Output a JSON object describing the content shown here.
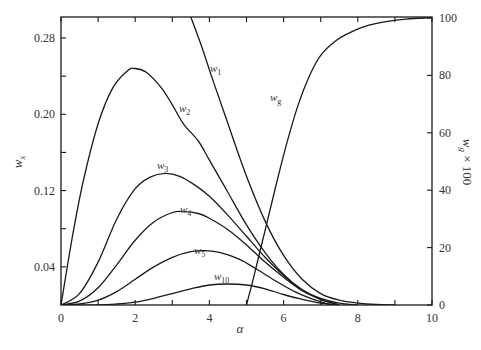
{
  "chart_data": {
    "type": "line",
    "title": "",
    "xlabel": "α",
    "ylabel_left": "w_x",
    "ylabel_right": "w_g × 100",
    "xlim": [
      0,
      10
    ],
    "ylim_left": [
      0,
      0.302
    ],
    "ylim_right": [
      0,
      100
    ],
    "x_ticks": [
      0,
      2,
      4,
      6,
      8,
      10
    ],
    "x_minor_ticks": [
      1,
      3,
      5,
      7,
      9
    ],
    "y_left_ticks": [
      "0.04",
      "0.12",
      "0.20",
      "0.28"
    ],
    "y_left_tick_values": [
      0.04,
      0.12,
      0.2,
      0.28
    ],
    "y_left_minor_ticks": [
      0.08,
      0.16,
      0.24
    ],
    "y_right_ticks": [
      0,
      20,
      40,
      60,
      80,
      100
    ],
    "grid": false,
    "legend": "inline labels",
    "series": [
      {
        "name": "w1",
        "label": "w",
        "sub": "1",
        "axis": "left",
        "x": [
          3.5,
          3.8,
          4.1,
          4.5,
          5.0,
          5.5,
          6.0,
          6.5,
          7.0,
          7.5,
          8.0,
          8.5,
          9.0
        ],
        "y": [
          0.302,
          0.27,
          0.235,
          0.19,
          0.135,
          0.088,
          0.052,
          0.027,
          0.012,
          0.005,
          0.002,
          0.0005,
          0.0
        ]
      },
      {
        "name": "w2",
        "label": "w",
        "sub": "2",
        "axis": "left",
        "x": [
          0,
          0.3,
          0.6,
          1.0,
          1.4,
          1.8,
          2.0,
          2.3,
          2.7,
          3.0,
          3.3,
          3.7,
          4.0,
          4.5,
          5.0,
          5.5,
          6.0,
          6.5,
          7.0,
          7.5,
          8.0
        ],
        "y": [
          0.0,
          0.07,
          0.13,
          0.19,
          0.228,
          0.246,
          0.248,
          0.244,
          0.228,
          0.21,
          0.19,
          0.172,
          0.152,
          0.118,
          0.084,
          0.055,
          0.032,
          0.016,
          0.007,
          0.002,
          0.0
        ]
      },
      {
        "name": "w3",
        "label": "w",
        "sub": "3",
        "axis": "left",
        "x": [
          0,
          0.5,
          1.0,
          1.5,
          2.0,
          2.4,
          2.8,
          3.2,
          3.6,
          4.0,
          4.5,
          5.0,
          5.5,
          6.0,
          6.5,
          7.0,
          7.5
        ],
        "y": [
          0.0,
          0.012,
          0.045,
          0.09,
          0.122,
          0.134,
          0.138,
          0.135,
          0.126,
          0.114,
          0.094,
          0.072,
          0.05,
          0.031,
          0.016,
          0.006,
          0.0
        ]
      },
      {
        "name": "w4",
        "label": "w",
        "sub": "4",
        "axis": "left",
        "x": [
          0,
          0.5,
          1.0,
          1.5,
          2.0,
          2.5,
          3.0,
          3.3,
          3.7,
          4.0,
          4.5,
          5.0,
          5.5,
          6.0,
          6.5,
          7.0,
          7.5
        ],
        "y": [
          0.0,
          0.004,
          0.018,
          0.042,
          0.068,
          0.087,
          0.097,
          0.098,
          0.096,
          0.091,
          0.079,
          0.063,
          0.045,
          0.029,
          0.015,
          0.006,
          0.0
        ]
      },
      {
        "name": "w5",
        "label": "w",
        "sub": "5",
        "axis": "left",
        "x": [
          0,
          0.5,
          1.0,
          1.5,
          2.0,
          2.5,
          3.0,
          3.5,
          3.9,
          4.3,
          4.8,
          5.3,
          5.8,
          6.3,
          6.8,
          7.3
        ],
        "y": [
          0.0,
          0.001,
          0.005,
          0.014,
          0.027,
          0.04,
          0.05,
          0.056,
          0.057,
          0.055,
          0.048,
          0.037,
          0.025,
          0.014,
          0.006,
          0.0
        ]
      },
      {
        "name": "w10",
        "label": "w",
        "sub": "10",
        "axis": "left",
        "x": [
          0,
          1.0,
          1.5,
          2.0,
          2.5,
          3.0,
          3.5,
          4.0,
          4.5,
          5.0,
          5.5,
          6.0,
          6.5,
          7.0,
          7.5
        ],
        "y": [
          0.0,
          0.0,
          0.001,
          0.003,
          0.007,
          0.012,
          0.017,
          0.021,
          0.022,
          0.021,
          0.017,
          0.011,
          0.006,
          0.002,
          0.0
        ]
      },
      {
        "name": "wg",
        "label": "w",
        "sub": "g",
        "axis": "right",
        "x": [
          5.0,
          5.2,
          5.5,
          5.8,
          6.1,
          6.4,
          6.7,
          7.0,
          7.4,
          7.8,
          8.3,
          8.8,
          9.3,
          9.8,
          10.0
        ],
        "y": [
          0,
          10,
          26,
          42,
          57,
          70,
          80,
          87,
          92,
          95,
          97.5,
          98.8,
          99.6,
          100,
          100
        ]
      }
    ],
    "annotations": [
      {
        "text": "w1",
        "x_px": 210,
        "y_px": 72
      },
      {
        "text": "w2",
        "x_px": 179,
        "y_px": 112
      },
      {
        "text": "w3",
        "x_px": 157,
        "y_px": 169
      },
      {
        "text": "w4",
        "x_px": 180,
        "y_px": 213
      },
      {
        "text": "w5",
        "x_px": 194,
        "y_px": 254
      },
      {
        "text": "w10",
        "x_px": 214,
        "y_px": 280
      },
      {
        "text": "wg",
        "x_px": 270,
        "y_px": 101
      }
    ]
  },
  "labels": {
    "x_axis": "α",
    "y_left_main": "w",
    "y_left_sub": "x",
    "y_right_main": "w",
    "y_right_sub": "g",
    "y_right_suffix": " × 100"
  }
}
